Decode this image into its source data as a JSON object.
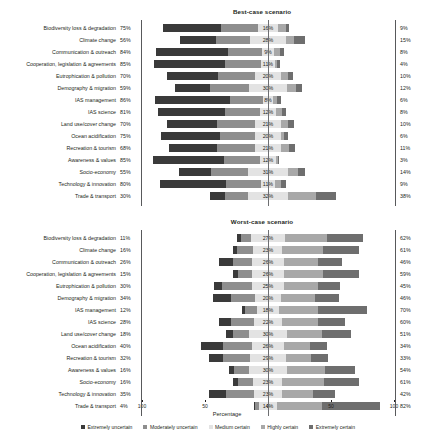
{
  "chart_data": {
    "type": "bar",
    "subtype": "diverging-stacked-bar",
    "title": "",
    "xlabel": "Percentage",
    "ylabel": "",
    "grid": false,
    "legend_position": "bottom",
    "series_names": [
      "Extremely uncertain",
      "Moderately uncertain",
      "Medium certain",
      "Highly certain",
      "Extremely certain"
    ],
    "series_colors": [
      "#3a3a3a",
      "#8e8e8e",
      "#e3e3e3",
      "#a8a8a8",
      "#6e6e6e"
    ],
    "axis_ticks": [
      "100",
      "50",
      "0",
      "50",
      "100"
    ],
    "xlim": [
      -100,
      100
    ],
    "categories": [
      "Biodiversity loss & degradation",
      "Climate change",
      "Communication & outreach",
      "Cooperation, legislation & agreements",
      "Eutrophication & pollution",
      "Demography & migration",
      "IAS management",
      "IAS science",
      "Land use/cover change",
      "Ocean acidification",
      "Recreation & tourism",
      "Awareness & values",
      "Socio-economy",
      "Technology & innovation",
      "Trade & transport"
    ],
    "panels": [
      {
        "name": "best",
        "title": "Best-case scenario",
        "left_totals": [
          "75%",
          "56%",
          "84%",
          "85%",
          "70%",
          "59%",
          "86%",
          "81%",
          "70%",
          "75%",
          "68%",
          "85%",
          "55%",
          "80%",
          "30%"
        ],
        "right_totals": [
          "9%",
          "15%",
          "8%",
          "4%",
          "10%",
          "12%",
          "6%",
          "8%",
          "10%",
          "6%",
          "11%",
          "3%",
          "14%",
          "9%",
          "38%"
        ],
        "middle_labels": [
          "16%",
          "28%",
          "9%",
          "11%",
          "20%",
          "30%",
          "8%",
          "12%",
          "21%",
          "20%",
          "21%",
          "12%",
          "31%",
          "11%",
          "32%"
        ],
        "rows": [
          {
            "extremely_uncertain": 46,
            "moderately_uncertain": 29,
            "medium_certain": 16,
            "highly_certain": 6,
            "extremely_certain": 3
          },
          {
            "extremely_uncertain": 29,
            "moderately_uncertain": 27,
            "medium_certain": 28,
            "highly_certain": 7,
            "extremely_certain": 8
          },
          {
            "extremely_uncertain": 57,
            "moderately_uncertain": 27,
            "medium_certain": 9,
            "highly_certain": 5,
            "extremely_certain": 3
          },
          {
            "extremely_uncertain": 56,
            "moderately_uncertain": 29,
            "medium_certain": 11,
            "highly_certain": 2,
            "extremely_certain": 2
          },
          {
            "extremely_uncertain": 40,
            "moderately_uncertain": 30,
            "medium_certain": 20,
            "highly_certain": 6,
            "extremely_certain": 4
          },
          {
            "extremely_uncertain": 28,
            "moderately_uncertain": 31,
            "medium_certain": 30,
            "highly_certain": 7,
            "extremely_certain": 5
          },
          {
            "extremely_uncertain": 60,
            "moderately_uncertain": 26,
            "medium_certain": 8,
            "highly_certain": 3,
            "extremely_certain": 3
          },
          {
            "extremely_uncertain": 53,
            "moderately_uncertain": 28,
            "medium_certain": 12,
            "highly_certain": 5,
            "extremely_certain": 3
          },
          {
            "extremely_uncertain": 40,
            "moderately_uncertain": 30,
            "medium_certain": 21,
            "highly_certain": 5,
            "extremely_certain": 5
          },
          {
            "extremely_uncertain": 47,
            "moderately_uncertain": 28,
            "medium_certain": 20,
            "highly_certain": 3,
            "extremely_certain": 3
          },
          {
            "extremely_uncertain": 38,
            "moderately_uncertain": 30,
            "medium_certain": 21,
            "highly_certain": 6,
            "extremely_certain": 5
          },
          {
            "extremely_uncertain": 56,
            "moderately_uncertain": 29,
            "medium_certain": 12,
            "highly_certain": 2,
            "extremely_certain": 1
          },
          {
            "extremely_uncertain": 25,
            "moderately_uncertain": 30,
            "medium_certain": 31,
            "highly_certain": 8,
            "extremely_certain": 6
          },
          {
            "extremely_uncertain": 52,
            "moderately_uncertain": 28,
            "medium_certain": 11,
            "highly_certain": 5,
            "extremely_certain": 4
          },
          {
            "extremely_uncertain": 12,
            "moderately_uncertain": 18,
            "medium_certain": 32,
            "highly_certain": 22,
            "extremely_certain": 16
          }
        ]
      },
      {
        "name": "worst",
        "title": "Worst-case scenario",
        "left_totals": [
          "11%",
          "16%",
          "26%",
          "15%",
          "30%",
          "34%",
          "12%",
          "28%",
          "18%",
          "40%",
          "32%",
          "16%",
          "16%",
          "35%",
          "4%"
        ],
        "right_totals": [
          "62%",
          "61%",
          "46%",
          "59%",
          "45%",
          "46%",
          "70%",
          "60%",
          "51%",
          "34%",
          "33%",
          "54%",
          "61%",
          "42%",
          "82%"
        ],
        "middle_labels": [
          "27%",
          "23%",
          "26%",
          "26%",
          "25%",
          "20%",
          "18%",
          "22%",
          "30%",
          "26%",
          "29%",
          "30%",
          "23%",
          "23%",
          "14%"
        ],
        "rows": [
          {
            "extremely_uncertain": 3,
            "moderately_uncertain": 8,
            "medium_certain": 27,
            "highly_certain": 33,
            "extremely_certain": 29
          },
          {
            "extremely_uncertain": 3,
            "moderately_uncertain": 13,
            "medium_certain": 23,
            "highly_certain": 32,
            "extremely_certain": 29
          },
          {
            "extremely_uncertain": 11,
            "moderately_uncertain": 15,
            "medium_certain": 26,
            "highly_certain": 27,
            "extremely_certain": 19
          },
          {
            "extremely_uncertain": 4,
            "moderately_uncertain": 11,
            "medium_certain": 26,
            "highly_certain": 31,
            "extremely_certain": 28
          },
          {
            "extremely_uncertain": 6,
            "moderately_uncertain": 24,
            "medium_certain": 25,
            "highly_certain": 27,
            "extremely_certain": 18
          },
          {
            "extremely_uncertain": 15,
            "moderately_uncertain": 19,
            "medium_certain": 20,
            "highly_certain": 27,
            "extremely_certain": 19
          },
          {
            "extremely_uncertain": 3,
            "moderately_uncertain": 9,
            "medium_certain": 18,
            "highly_certain": 31,
            "extremely_certain": 39
          },
          {
            "extremely_uncertain": 10,
            "moderately_uncertain": 18,
            "medium_certain": 22,
            "highly_certain": 29,
            "extremely_certain": 21
          },
          {
            "extremely_uncertain": 5,
            "moderately_uncertain": 13,
            "medium_certain": 30,
            "highly_certain": 28,
            "extremely_certain": 23
          },
          {
            "extremely_uncertain": 17,
            "moderately_uncertain": 23,
            "medium_certain": 26,
            "highly_certain": 20,
            "extremely_certain": 14
          },
          {
            "extremely_uncertain": 11,
            "moderately_uncertain": 21,
            "medium_certain": 29,
            "highly_certain": 20,
            "extremely_certain": 13
          },
          {
            "extremely_uncertain": 4,
            "moderately_uncertain": 12,
            "medium_certain": 30,
            "highly_certain": 30,
            "extremely_certain": 24
          },
          {
            "extremely_uncertain": 4,
            "moderately_uncertain": 12,
            "medium_certain": 23,
            "highly_certain": 33,
            "extremely_certain": 28
          },
          {
            "extremely_uncertain": 13,
            "moderately_uncertain": 22,
            "medium_certain": 23,
            "highly_certain": 24,
            "extremely_certain": 18
          },
          {
            "extremely_uncertain": 1,
            "moderately_uncertain": 3,
            "medium_certain": 14,
            "highly_certain": 36,
            "extremely_certain": 46
          }
        ]
      }
    ]
  }
}
